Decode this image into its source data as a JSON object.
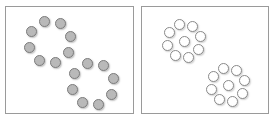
{
  "figure": {
    "background_color": "#ffffff",
    "width": 276,
    "height": 125
  },
  "panels": [
    {
      "id": "left",
      "label": "Left panel",
      "border_color": "#9a9a9a",
      "background_color": "#ffffff",
      "x": 5,
      "y": 6,
      "width": 129,
      "height": 108,
      "dot_style": "filled",
      "dot_fill_color": "#b9b9b9",
      "dot_border_color": "#7d7d7d",
      "dot_diameter": 11,
      "clusters": [
        {
          "id": "left-top",
          "label": "Left panel upper cluster",
          "center_x": 49,
          "center_y": 41,
          "ring_radius": 21,
          "ring_count": 8,
          "has_center_dot": false,
          "total_count": 8,
          "ring_start_angle_deg": -105
        },
        {
          "id": "left-bottom",
          "label": "Left panel lower cluster",
          "center_x": 92,
          "center_y": 83,
          "ring_radius": 21,
          "ring_count": 8,
          "has_center_dot": false,
          "total_count": 8,
          "ring_start_angle_deg": -105
        }
      ]
    },
    {
      "id": "right",
      "label": "Right panel",
      "border_color": "#9a9a9a",
      "background_color": "#ffffff",
      "x": 141,
      "y": 6,
      "width": 128,
      "height": 108,
      "dot_style": "hollow",
      "dot_fill_color": "#ffffff",
      "dot_border_color": "#8a8a8a",
      "dot_diameter": 11,
      "clusters": [
        {
          "id": "right-top",
          "label": "Right panel upper cluster",
          "center_x": 183,
          "center_y": 40,
          "ring_radius": 17,
          "ring_count": 8,
          "has_center_dot": true,
          "total_count": 9,
          "ring_start_angle_deg": -105
        },
        {
          "id": "right-bottom",
          "label": "Right panel lower cluster",
          "center_x": 227,
          "center_y": 84,
          "ring_radius": 17,
          "ring_count": 8,
          "has_center_dot": true,
          "total_count": 9,
          "ring_start_angle_deg": -105
        }
      ]
    }
  ],
  "chart_data": {
    "type": "scatter",
    "xlabel": "",
    "ylabel": "",
    "xlim": [
      0,
      276
    ],
    "ylim": [
      0,
      125
    ],
    "grid": false,
    "legend": "none",
    "series": [
      {
        "name": "Left panel filled circles",
        "marker": "filled-circle",
        "fill_color": "#b9b9b9",
        "edge_color": "#7d7d7d",
        "marker_diameter": 11,
        "count": 16,
        "values": [
          [
            43.6,
            20.7
          ],
          [
            55.3,
            21.9
          ],
          [
            65.3,
            28.9
          ],
          [
            69.0,
            40.4
          ],
          [
            65.0,
            52.0
          ],
          [
            55.0,
            59.3
          ],
          [
            43.3,
            58.6
          ],
          [
            33.9,
            51.1
          ],
          [
            29.4,
            40.0
          ],
          [
            33.1,
            28.7
          ]
        ]
      },
      {
        "name": "Right panel hollow circles",
        "marker": "hollow-circle",
        "fill_color": "#ffffff",
        "edge_color": "#8a8a8a",
        "marker_diameter": 11,
        "count": 18,
        "values": []
      }
    ],
    "annotations": [
      "Left panel: two rings of 8 gray-filled circles, empty centers",
      "Right panel: two clusters of 9 white hollow circles (8 ring + 1 center)"
    ]
  }
}
